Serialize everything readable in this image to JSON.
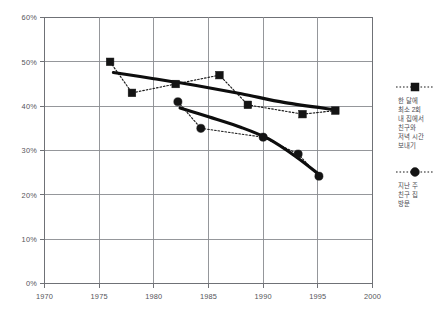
{
  "chart_data": {
    "type": "line",
    "title": "",
    "subtitle": "",
    "xlabel": "",
    "ylabel": "",
    "xlim": [
      1970,
      2000
    ],
    "ylim": [
      0,
      60
    ],
    "grid": true,
    "legend_position": "right",
    "x_ticks": [
      "1970",
      "1975",
      "1980",
      "1985",
      "1990",
      "1995",
      "2000"
    ],
    "x_tick_values": [
      1970,
      1975,
      1980,
      1985,
      1990,
      1995,
      2000
    ],
    "y_ticks": [
      "0%",
      "10%",
      "20%",
      "30%",
      "40%",
      "50%",
      "60%"
    ],
    "y_tick_values": [
      0,
      10,
      20,
      30,
      40,
      50,
      60
    ],
    "series": [
      {
        "name": "한 달에 최소 2회 내 집에서 친구와 저녁 시간 보내기",
        "marker": "square",
        "line_style": "dotted",
        "trend_style": "solid-thick",
        "x": [
          1976,
          1978,
          1982,
          1986,
          1988.6,
          1993.6,
          1996.6
        ],
        "values": [
          50.0,
          43.0,
          45.0,
          47.0,
          40.3,
          38.2,
          39.0
        ],
        "trend_x": [
          1976.3,
          1980,
          1984,
          1988,
          1992,
          1996.6
        ],
        "trend_values": [
          47.6,
          46.2,
          44.6,
          42.8,
          40.8,
          39.2
        ]
      },
      {
        "name": "지난 주 친구 집 방문",
        "marker": "circle",
        "line_style": "dotted",
        "trend_style": "solid-thick",
        "x": [
          1982.2,
          1984.3,
          1990,
          1993.2,
          1995.1
        ],
        "values": [
          41.0,
          35.0,
          33.0,
          29.2,
          24.2
        ],
        "trend_x": [
          1982.4,
          1985,
          1988,
          1990.5,
          1993,
          1995.1
        ],
        "trend_values": [
          39.6,
          37.6,
          35.2,
          32.6,
          28.6,
          24.6
        ]
      }
    ]
  },
  "legend": {
    "entries": [
      {
        "marker": "square",
        "label_lines": [
          "한 달에",
          "최소 2회",
          "내 집에서",
          "친구와",
          "저녁 시간",
          "보내기"
        ]
      },
      {
        "marker": "circle",
        "label_lines": [
          "지난 주",
          "친구 집",
          "방문"
        ]
      }
    ]
  },
  "axes": {
    "y_labels": [
      "60%",
      "50%",
      "40%",
      "30%",
      "20%",
      "10%",
      "0%"
    ],
    "x_labels": [
      "1970",
      "1975",
      "1980",
      "1985",
      "1990",
      "1995",
      "2000"
    ]
  }
}
